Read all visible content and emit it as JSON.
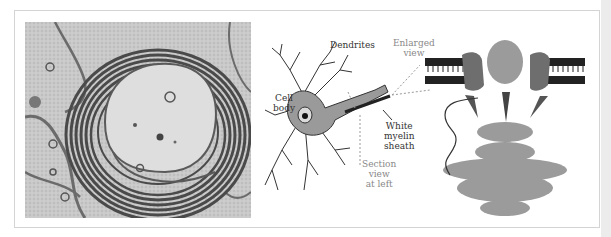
{
  "figure": {
    "panels": [
      {
        "id": "micrograph",
        "description": "Electron micrograph cross-section of a myelinated axon"
      },
      {
        "id": "neuron-diagram",
        "description": "Neuron drawing with myelin sheath"
      },
      {
        "id": "protein-structure",
        "description": "Membrane protein complex in lipid bilayer"
      }
    ],
    "labels": {
      "dendrites": "Dendrites",
      "cell_body_1": "Cell",
      "cell_body_2": "body",
      "enlarged_1": "Enlarged",
      "enlarged_2": "view",
      "white_1": "White",
      "white_2": "myelin",
      "white_3": "sheath",
      "section_1": "Section",
      "section_2": "view",
      "section_3": "at left"
    },
    "colors": {
      "frame_border": "#d4d4d4",
      "ink": "#333333",
      "annotation_gray": "#888888"
    }
  }
}
